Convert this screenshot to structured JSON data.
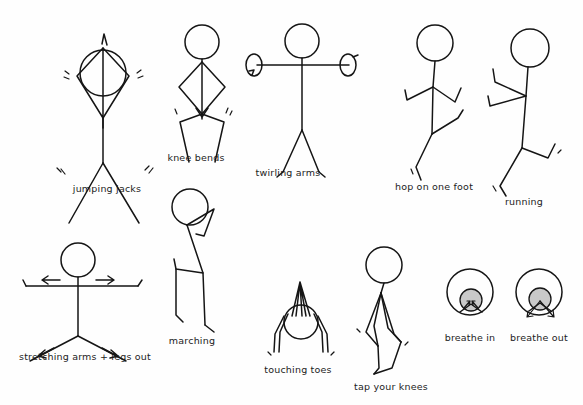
{
  "sheet": {
    "title": "Exercise Stick Figures",
    "width": 583,
    "height": 405,
    "background_color": "#fefefe",
    "ink_color": "#151515",
    "shade_color": "#c9c9c9"
  },
  "exercises": [
    {
      "id": "jumping-jacks",
      "label": "jumping jacks",
      "row": 1,
      "column": 1,
      "label_x": 107,
      "label_y": 183,
      "figure_x": 55,
      "figure_y": 18,
      "pose": "arms raised overhead in diamond, legs spread apart, motion marks at hands and feet"
    },
    {
      "id": "knee-bends",
      "label": "knee bends",
      "row": 1,
      "column": 2,
      "label_x": 196,
      "label_y": 152,
      "figure_x": 158,
      "figure_y": 22,
      "pose": "arms bowed out in diamond at sides, knees bent outward with downward arrow"
    },
    {
      "id": "twirling-arms",
      "label": "twirling arms",
      "row": 1,
      "column": 3,
      "label_x": 288,
      "label_y": 167,
      "figure_x": 245,
      "figure_y": 22,
      "pose": "arms straight out horizontally with spiral rotation loops at both hands"
    },
    {
      "id": "hop-on-one-foot",
      "label": "hop on one foot",
      "row": 1,
      "column": 4,
      "label_x": 434,
      "label_y": 181,
      "figure_x": 385,
      "figure_y": 22,
      "pose": "arms bent at elbows, one leg raised and bent, one leg down with motion mark"
    },
    {
      "id": "running",
      "label": "running",
      "row": 1,
      "column": 5,
      "label_x": 524,
      "label_y": 196,
      "figure_x": 470,
      "figure_y": 18,
      "pose": "body leaning forward, arms pumping bent, legs in stride with motion marks"
    },
    {
      "id": "stretching-arms-legs-out",
      "label": "stretching arms + legs out",
      "row": 2,
      "column": 1,
      "label_x": 85,
      "label_y": 351,
      "figure_x": 16,
      "figure_y": 238,
      "pose": "arms straight out with outward arrows, legs spread with outward arrows"
    },
    {
      "id": "marching",
      "label": "marching",
      "row": 2,
      "column": 2,
      "label_x": 192,
      "label_y": 335,
      "figure_x": 160,
      "figure_y": 185,
      "pose": "one arm swung up bent, one knee lifted high and bent"
    },
    {
      "id": "touching-toes",
      "label": "touching toes",
      "row": 2,
      "column": 3,
      "label_x": 298,
      "label_y": 364,
      "figure_x": 262,
      "figure_y": 276,
      "pose": "bent fully forward, head down, arms hanging to feet, body folded"
    },
    {
      "id": "tap-your-knees",
      "label": "tap your knees",
      "row": 2,
      "column": 4,
      "label_x": 391,
      "label_y": 381,
      "figure_x": 348,
      "figure_y": 246,
      "pose": "leaning with arms reaching down to bent knees"
    },
    {
      "id": "breathe-in",
      "label": "breathe in",
      "row": 2,
      "column": 5,
      "label_x": 470,
      "label_y": 332,
      "figure_x": 444,
      "figure_y": 268,
      "pose": "large outer circle with shaded inner head circle, arrows pointing inward"
    },
    {
      "id": "breathe-out",
      "label": "breathe out",
      "row": 2,
      "column": 6,
      "label_x": 539,
      "label_y": 332,
      "figure_x": 513,
      "figure_y": 268,
      "pose": "large outer circle with shaded inner head circle, arrows pointing outward"
    }
  ]
}
